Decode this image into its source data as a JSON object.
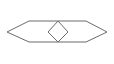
{
  "canvas": {
    "width": 114,
    "height": 64,
    "background_color": "#ffffff",
    "title": "",
    "caption": ""
  },
  "style": {
    "stroke_color": "#6b6b6b",
    "stroke_width": 1,
    "fill": "none"
  },
  "figure": {
    "name": "elongated-hexagon-with-center-diamond",
    "shapes": [
      {
        "name": "outer-hexagon",
        "type": "polygon",
        "sides": 6,
        "points": "7,32 29,21 86,21 107,32 86,42 29,42",
        "vertices": [
          {
            "label": "left-tip",
            "x": 7,
            "y": 32
          },
          {
            "label": "top-left-shoulder",
            "x": 29,
            "y": 21
          },
          {
            "label": "top-right-shoulder",
            "x": 86,
            "y": 21
          },
          {
            "label": "right-tip",
            "x": 107,
            "y": 32
          },
          {
            "label": "bottom-right-shoulder",
            "x": 86,
            "y": 42
          },
          {
            "label": "bottom-left-shoulder",
            "x": 29,
            "y": 42
          }
        ]
      },
      {
        "name": "inner-diamond",
        "type": "polygon",
        "sides": 4,
        "points": "58,21 68,32 58,42 48,32",
        "vertices": [
          {
            "label": "top",
            "x": 58,
            "y": 21
          },
          {
            "label": "right",
            "x": 68,
            "y": 32
          },
          {
            "label": "bottom",
            "x": 58,
            "y": 42
          },
          {
            "label": "left",
            "x": 48,
            "y": 32
          }
        ]
      }
    ]
  }
}
